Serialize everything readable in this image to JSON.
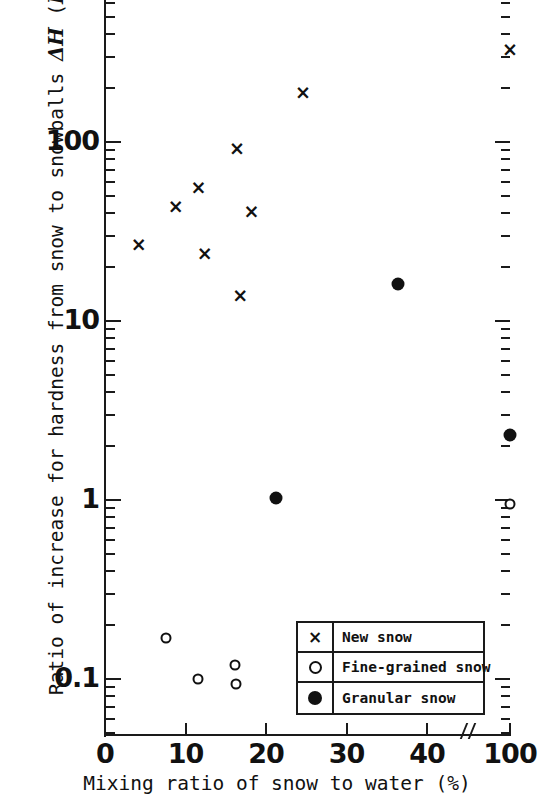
{
  "chart_data": {
    "type": "scatter",
    "title": "",
    "xlabel": "Mixing ratio of snow to water (%)",
    "ylabel": "Ratio of increase for hardness from snow to snowballs ΔH (Hb/Ho)",
    "ylabel_prefix": "Ratio of increase for hardness from snow to snowballs ",
    "ylabel_symbol": "ΔH",
    "ylabel_paren_open": " (",
    "ylabel_h_b": "H",
    "ylabel_h_b_sub": "b",
    "ylabel_slash": "/",
    "ylabel_h_o": "H",
    "ylabel_h_o_sub": "o",
    "ylabel_paren_close": ")",
    "yscale": "log",
    "xscale": "linear-with-break",
    "ylim": [
      0.07,
      400
    ],
    "xlim": [
      0,
      100
    ],
    "grid": false,
    "legend_position": "bottom-right",
    "x_ticks": [
      "0",
      "10",
      "20",
      "30",
      "40",
      "100"
    ],
    "x_tick_values": [
      0,
      10,
      20,
      30,
      40,
      100
    ],
    "x_axis_break_after": 40,
    "y_ticks": [
      "0.1",
      "1",
      "10",
      "100"
    ],
    "y_tick_values": [
      0.1,
      1,
      10,
      100
    ],
    "series": [
      {
        "name": "New snow",
        "marker": "x",
        "points": [
          {
            "x": 4.2,
            "y": 27
          },
          {
            "x": 8.8,
            "y": 44
          },
          {
            "x": 11.6,
            "y": 56
          },
          {
            "x": 12.4,
            "y": 24
          },
          {
            "x": 16.4,
            "y": 92
          },
          {
            "x": 16.8,
            "y": 14
          },
          {
            "x": 18.2,
            "y": 41
          },
          {
            "x": 24.6,
            "y": 190
          },
          {
            "x": 100,
            "y": 330
          }
        ]
      },
      {
        "name": "Fine-grained snow",
        "marker": "o",
        "points": [
          {
            "x": 7.6,
            "y": 0.17
          },
          {
            "x": 11.6,
            "y": 0.1
          },
          {
            "x": 16.2,
            "y": 0.12
          },
          {
            "x": 16.3,
            "y": 0.094
          },
          {
            "x": 100,
            "y": 0.95
          }
        ]
      },
      {
        "name": "Granular snow",
        "marker": "filled",
        "points": [
          {
            "x": 21.3,
            "y": 1.03
          },
          {
            "x": 36.4,
            "y": 16
          },
          {
            "x": 100,
            "y": 2.3
          }
        ]
      }
    ]
  },
  "legend": {
    "rows": [
      {
        "symbol": "cross-marker",
        "label": "New snow"
      },
      {
        "symbol": "open-circle-marker",
        "label": "Fine-grained snow"
      },
      {
        "symbol": "filled-circle-marker",
        "label": "Granular snow"
      }
    ]
  },
  "marker_glyph": {
    "cross": "×"
  },
  "colors": {
    "ink": "#111111",
    "background": "#ffffff"
  }
}
